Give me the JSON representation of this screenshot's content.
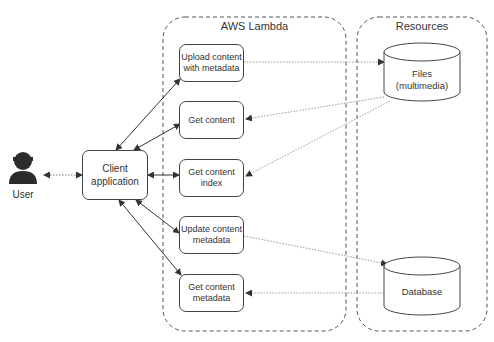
{
  "user": {
    "label": "User"
  },
  "client": {
    "label": "Client application"
  },
  "lambda": {
    "title": "AWS Lambda",
    "functions": [
      {
        "id": "upload",
        "label": "Upload content with metadata"
      },
      {
        "id": "get-content",
        "label": "Get content"
      },
      {
        "id": "get-index",
        "label": "Get content index"
      },
      {
        "id": "update-meta",
        "label": "Update content metadata"
      },
      {
        "id": "get-meta",
        "label": "Get content metadata"
      }
    ]
  },
  "resources": {
    "title": "Resources",
    "items": [
      {
        "id": "files",
        "label": "Files (multimedia)"
      },
      {
        "id": "database",
        "label": "Database"
      }
    ]
  },
  "colors": {
    "stroke": "#444444",
    "dotted": "#999999",
    "text": "#333333",
    "user_icon": "#2b2b2b"
  }
}
